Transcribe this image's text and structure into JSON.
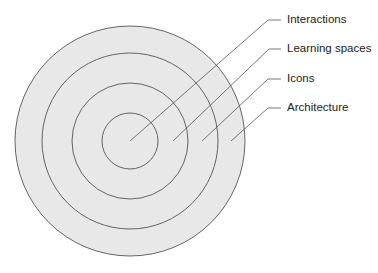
{
  "diagram": {
    "type": "concentric-layers",
    "fill_color": "#e8e8e8",
    "stroke_color": "#555555",
    "layers": [
      {
        "label": "Interactions",
        "radius": 28
      },
      {
        "label": "Learning spaces",
        "radius": 58
      },
      {
        "label": "Icons",
        "radius": 88
      },
      {
        "label": "Architecture",
        "radius": 115
      }
    ]
  }
}
